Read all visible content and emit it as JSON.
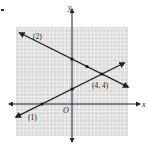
{
  "chart_data": {
    "type": "line",
    "title": "",
    "xlabel": "x",
    "ylabel": "y",
    "origin_label": "O",
    "xlim": [
      -7.5,
      7.5
    ],
    "ylim": [
      -4.3,
      10.3
    ],
    "grid": true,
    "grid_step": 1,
    "series": [
      {
        "name": "(1)",
        "equation": "y = x/2 + 2",
        "x": [
          -8,
          -4,
          0,
          4,
          7
        ],
        "y": [
          -2,
          0,
          2,
          4,
          5.5
        ],
        "marked_points": [
          [
            -4,
            0
          ],
          [
            0,
            2
          ]
        ]
      },
      {
        "name": "(2)",
        "equation": "y = -x/2 + 6",
        "x": [
          -7,
          0,
          2,
          4,
          7
        ],
        "y": [
          9.5,
          6,
          5,
          4,
          2.5
        ],
        "marked_points": [
          [
            0,
            6
          ],
          [
            2,
            5
          ]
        ]
      }
    ],
    "annotations": [
      {
        "text": "(4, 4)",
        "x": 4,
        "y": 4,
        "note": "intersection point"
      },
      {
        "text": "(1)",
        "attached_to": "series 1, lower-left"
      },
      {
        "text": "(2)",
        "attached_to": "series 2, upper-left"
      }
    ]
  },
  "labels": {
    "y_axis": "y",
    "x_axis": "x",
    "origin": "O",
    "line1": "(1)",
    "line2": "(2)",
    "intersection": "(4, 4)"
  }
}
